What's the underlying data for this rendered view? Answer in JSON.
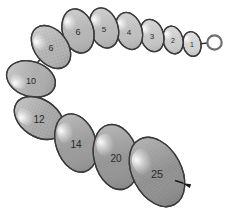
{
  "figure": {
    "background_color": "#ffffff",
    "outline_color": "#3a3a3a",
    "connector_color": "#2f2f2f",
    "label_color": "#2b2b2b",
    "highlight_color": "#f2f2f2",
    "terminator": {
      "name": "open-ring",
      "cx": 214.5,
      "cy": 42.5,
      "r": 7.2,
      "stroke": "#6e6e6e",
      "stroke_width": 2.2,
      "fill": "#ffffff"
    },
    "arrow_marker": {
      "name": "arrow-marker",
      "x": 182,
      "y": 183,
      "angle": 20,
      "color": "#1a1a1a",
      "length": 9,
      "width": 4
    }
  },
  "chart_data": {
    "type": "diagram",
    "xlabel": "",
    "ylabel": "",
    "labels": [
      "1",
      "2",
      "3",
      "4",
      "5",
      "6",
      "6",
      "10",
      "12",
      "14",
      "20",
      "25"
    ],
    "values": [
      1,
      2,
      3,
      4,
      5,
      6,
      6,
      10,
      12,
      14,
      20,
      25
    ],
    "nodes": [
      {
        "label": "1",
        "cx": 192.0,
        "cy": 44.0,
        "rx": 9.0,
        "ry": 12.5,
        "rotate": -12,
        "fill": "#e2e2e2"
      },
      {
        "label": "2",
        "cx": 173.0,
        "cy": 40.0,
        "rx": 10.0,
        "ry": 14.0,
        "rotate": -14,
        "fill": "#dadada"
      },
      {
        "label": "3",
        "cx": 152.0,
        "cy": 35.5,
        "rx": 11.5,
        "ry": 16.5,
        "rotate": -16,
        "fill": "#d4d4d4"
      },
      {
        "label": "4",
        "cx": 129.0,
        "cy": 31.0,
        "rx": 13.0,
        "ry": 19.0,
        "rotate": -17,
        "fill": "#cccccc"
      },
      {
        "label": "5",
        "cx": 104.0,
        "cy": 28.0,
        "rx": 14.0,
        "ry": 20.5,
        "rotate": -17,
        "fill": "#c7c7c7"
      },
      {
        "label": "6",
        "cx": 78.0,
        "cy": 31.0,
        "rx": 15.5,
        "ry": 22.5,
        "rotate": -16,
        "fill": "#c2c2c2"
      },
      {
        "label": "6",
        "cx": 51.0,
        "cy": 47.0,
        "rx": 16.5,
        "ry": 24.0,
        "rotate": -38,
        "fill": "#bebebe"
      },
      {
        "label": "10",
        "cx": 31.0,
        "cy": 79.0,
        "rx": 17.5,
        "ry": 25.0,
        "rotate": -72,
        "fill": "#bababa"
      },
      {
        "label": "12",
        "cx": 39.0,
        "cy": 118.0,
        "rx": 18.5,
        "ry": 27.0,
        "rotate": -56,
        "fill": "#b4b4b4"
      },
      {
        "label": "14",
        "cx": 76.0,
        "cy": 143.0,
        "rx": 20.0,
        "ry": 30.0,
        "rotate": -19,
        "fill": "#a6a6a6"
      },
      {
        "label": "20",
        "cx": 116.0,
        "cy": 157.0,
        "rx": 22.0,
        "ry": 33.0,
        "rotate": -14,
        "fill": "#a0a0a0"
      },
      {
        "label": "25",
        "cx": 157.0,
        "cy": 172.0,
        "rx": 24.5,
        "ry": 37.0,
        "rotate": -28,
        "fill": "#9b9b9b"
      }
    ],
    "connectors": [
      {
        "from": "25",
        "to": "20",
        "x1": 139.0,
        "y1": 150.0,
        "x2": 131.0,
        "y2": 145.0
      },
      {
        "from": "20",
        "to": "14",
        "x1": 98.0,
        "y1": 139.0,
        "x2": 91.0,
        "y2": 136.0
      },
      {
        "from": "14",
        "to": "12",
        "x1": 59.0,
        "y1": 126.0,
        "x2": 53.0,
        "y2": 122.0
      },
      {
        "from": "12",
        "to": "10",
        "x1": 31.0,
        "y1": 97.0,
        "x2": 29.0,
        "y2": 91.0
      },
      {
        "from": "10",
        "to": "6b",
        "x1": 38.0,
        "y1": 62.0,
        "x2": 42.0,
        "y2": 57.0
      },
      {
        "from": "6b",
        "to": "6a",
        "x1": 63.0,
        "y1": 42.0,
        "x2": 69.0,
        "y2": 39.0
      },
      {
        "from": "6a",
        "to": "5",
        "x1": 90.0,
        "y1": 31.0,
        "x2": 96.0,
        "y2": 30.0
      },
      {
        "from": "5",
        "to": "4",
        "x1": 115.0,
        "y1": 29.0,
        "x2": 121.0,
        "y2": 29.0
      },
      {
        "from": "4",
        "to": "3",
        "x1": 140.0,
        "y1": 33.0,
        "x2": 145.0,
        "y2": 34.0
      },
      {
        "from": "3",
        "to": "2",
        "x1": 162.0,
        "y1": 37.5,
        "x2": 166.0,
        "y2": 38.5
      },
      {
        "from": "2",
        "to": "1",
        "x1": 181.0,
        "y1": 42.0,
        "x2": 185.0,
        "y2": 43.0
      },
      {
        "from": "1",
        "to": "ring",
        "x1": 199.0,
        "y1": 44.0,
        "x2": 207.5,
        "y2": 43.0
      }
    ],
    "label_font_sizes": [
      7,
      7,
      8,
      8,
      8,
      9,
      9,
      9,
      10,
      10,
      10,
      11
    ],
    "legend": [],
    "grid": false
  }
}
